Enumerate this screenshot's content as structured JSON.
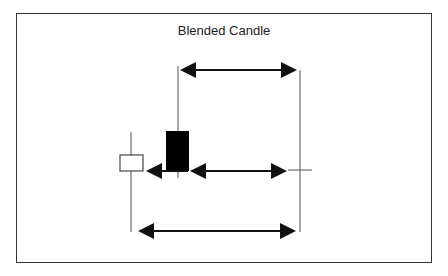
{
  "diagram": {
    "title": "Blended Candle",
    "elements": [
      {
        "type": "candle",
        "name": "white-candle",
        "color": "#ffffff"
      },
      {
        "type": "candle",
        "name": "black-candle",
        "color": "#000000"
      },
      {
        "type": "blended-candle-line",
        "name": "resulting-range"
      },
      {
        "type": "arrow",
        "name": "top-arrow"
      },
      {
        "type": "arrow",
        "name": "middle-arrow"
      },
      {
        "type": "arrow",
        "name": "bottom-arrow"
      }
    ]
  }
}
